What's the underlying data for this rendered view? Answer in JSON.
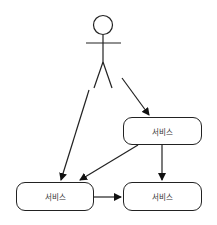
{
  "diagram": {
    "type": "use-case",
    "actor": {
      "label": ""
    },
    "nodes": [
      {
        "id": "service-top",
        "label": "서비스"
      },
      {
        "id": "service-bottom-left",
        "label": "서비스"
      },
      {
        "id": "service-bottom-right",
        "label": "서비스"
      }
    ],
    "edges": [
      {
        "from": "actor",
        "to": "service-top"
      },
      {
        "from": "actor",
        "to": "service-bottom-left"
      },
      {
        "from": "service-top",
        "to": "service-bottom-left"
      },
      {
        "from": "service-top",
        "to": "service-bottom-right"
      },
      {
        "from": "service-bottom-left",
        "to": "service-bottom-right"
      }
    ]
  }
}
